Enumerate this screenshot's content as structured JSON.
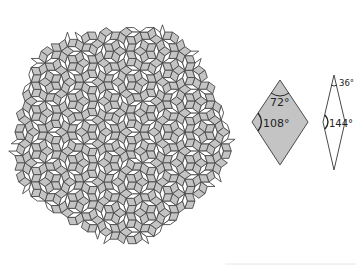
{
  "figure": {
    "colors": {
      "background": "#ffffff",
      "thick_fill": "#c4c4c4",
      "thin_fill": "#ffffff",
      "stroke": "#4a4a4a",
      "bottom_rule": "#e6e6e6"
    },
    "tiling": {
      "center": [
        120,
        132
      ],
      "radius": 106,
      "edge_length": 10.5,
      "rotation_deg": 18
    },
    "tiles": {
      "thick": {
        "name": "thick rhombus",
        "fill": "gray",
        "vertices": {
          "top": [
            280,
            80
          ],
          "right": [
            308,
            122
          ],
          "bottom": [
            280,
            165
          ],
          "left": [
            252,
            122
          ]
        },
        "angles": [
          {
            "label": "72°",
            "at": "top",
            "x": 270,
            "y": 106
          },
          {
            "label": "108°",
            "at": "left",
            "x": 263,
            "y": 127
          }
        ]
      },
      "thin": {
        "name": "thin rhombus",
        "fill": "white",
        "vertices": {
          "top": [
            334,
            75
          ],
          "right": [
            345,
            122
          ],
          "bottom": [
            334,
            170
          ],
          "left": [
            323,
            122
          ]
        },
        "angles": [
          {
            "label": "36°",
            "at": "top",
            "x": 339,
            "y": 86
          },
          {
            "label": "144°",
            "at": "left",
            "x": 329,
            "y": 127
          }
        ]
      }
    }
  }
}
